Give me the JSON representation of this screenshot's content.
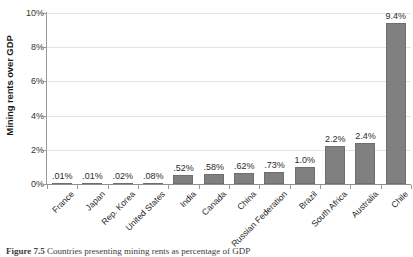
{
  "chart_data": {
    "type": "bar",
    "title": "",
    "xlabel": "",
    "ylabel": "Mining rents over GDP",
    "ylim": [
      0,
      10
    ],
    "ytick_labels": [
      "0%",
      "2%",
      "4%",
      "6%",
      "8%",
      "10%"
    ],
    "ytick_values": [
      0,
      2,
      4,
      6,
      8,
      10
    ],
    "grid": true,
    "legend": "none",
    "categories": [
      "France",
      "Japan",
      "Rep. Korea",
      "United States",
      "India",
      "Canada",
      "China",
      "Russian Federation",
      "Brazil",
      "South Africa",
      "Australia",
      "Chile"
    ],
    "values": [
      0.01,
      0.01,
      0.02,
      0.08,
      0.52,
      0.58,
      0.62,
      0.73,
      1.0,
      2.2,
      2.4,
      9.4
    ],
    "data_labels": [
      ".01%",
      ".01%",
      ".02%",
      ".08%",
      ".52%",
      ".58%",
      ".62%",
      ".73%",
      "1.0%",
      "2.2%",
      "2.4%",
      "9.4%"
    ],
    "series_color": "#808080",
    "gridline_color": "#e4e4e4",
    "axis_color": "#9a9a9a"
  },
  "caption": {
    "number": "Figure 7.5",
    "text": "Countries presenting mining rents as percentage of GDP"
  }
}
